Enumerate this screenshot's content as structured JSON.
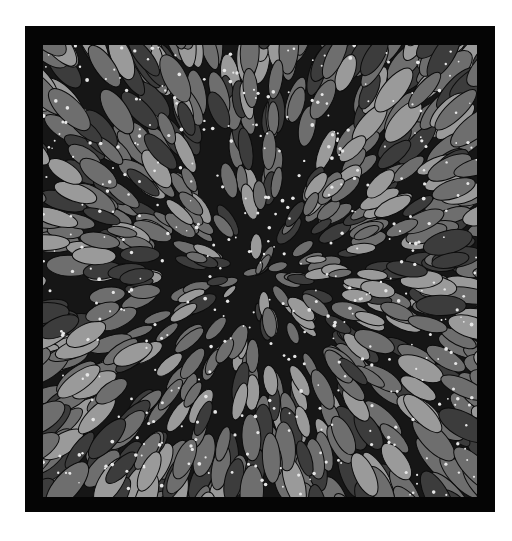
{
  "artwork": {
    "subject": "radial burst of leaf-shaped petals with small white dots",
    "palette": {
      "page_background": "#ffffff",
      "frame": "#050505",
      "ground": "#161616",
      "petal_light": "#9a9a9a",
      "petal_mid": "#6e6e6e",
      "petal_dark": "#3c3c3c",
      "dot": "#e6e6e6"
    },
    "frame": {
      "x": 25,
      "y": 26,
      "width": 470,
      "height": 486
    },
    "canvas": {
      "x": 43,
      "y": 45,
      "width": 434,
      "height": 452
    },
    "center": {
      "x": 258,
      "y": 272
    },
    "petal_count": 1400,
    "dot_count": 420
  }
}
